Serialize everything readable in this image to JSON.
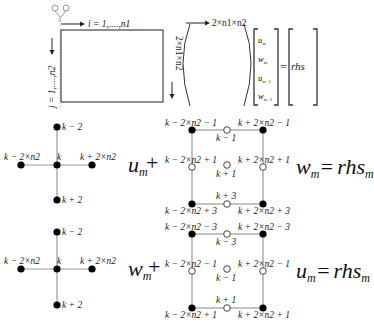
{
  "matrix_panel": {
    "row_index_label": "i = 1,....,n1",
    "col_index_label": "j = 1,....,n2",
    "matrix_width_label": "2×n1×n2",
    "matrix_height_label": "2×n1×n2",
    "vector_entries": [
      "u_m",
      "w_m",
      "u_m+1",
      "w_m+1"
    ],
    "equals": "=",
    "rhs_label": "rhs"
  },
  "stencil_u": {
    "cross_labels": {
      "top": "k − 2",
      "left": "k − 2×n2",
      "center": "k",
      "right": "k + 2×n2",
      "bottom": "k + 2"
    },
    "term_label": "u",
    "term_sub": "m",
    "plus": "+",
    "box_labels": {
      "top_left": "k − 2×n2 − 1",
      "top_right": "k + 2×n2 − 1",
      "top_mid": "k − 1",
      "mid_left": "k − 2×n2 + 1",
      "mid_right": "k + 2×n2 + 1",
      "center": "k + 1",
      "bottom_mid": "k + 3",
      "bottom_left": "k − 2×n2 + 3",
      "bottom_right": "k + 2×n2 + 3"
    },
    "result_var": "w",
    "result_sub": "m",
    "equals": "=",
    "rhs": "rhs",
    "rhs_sub": "m"
  },
  "stencil_w": {
    "cross_labels": {
      "top": "k − 2",
      "left": "k − 2×n2",
      "center": "k",
      "right": "k + 2×n2",
      "bottom": "k + 2"
    },
    "term_label": "w",
    "term_sub": "m",
    "plus": "+",
    "box_labels": {
      "top_left": "k − 2×n2 − 3",
      "top_right": "k + 2×n2 − 3",
      "top_mid": "k − 3",
      "mid_left": "k − 2×n2 − 1",
      "mid_right": "k + 2×n2 − 1",
      "center": "k − 1",
      "bottom_mid": "k + 1",
      "bottom_left": "k − 2×n2 + 1",
      "bottom_right": "k + 2×n2 + 1"
    },
    "result_var": "u",
    "result_sub": "m",
    "equals": "=",
    "rhs": "rhs",
    "rhs_sub": "m"
  },
  "icons": {
    "compass": "grid-origin-icon"
  }
}
